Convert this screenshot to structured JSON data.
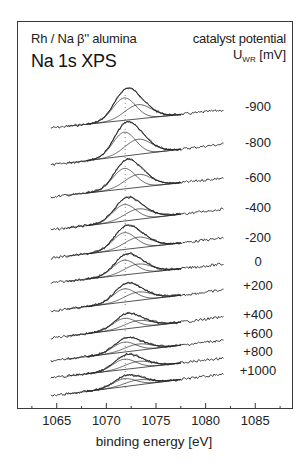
{
  "chart_data": {
    "type": "line",
    "title": "Na 1s XPS",
    "subtitle": "Rh / Na β'' alumina",
    "xlabel": "binding energy [eV]",
    "ylabel": "",
    "legend_title": "catalyst potential",
    "legend_unit_main": "U",
    "legend_unit_sub": "WR",
    "legend_unit_tail": " [mV]",
    "legend_position": "right",
    "grid": false,
    "xlim": [
      1061,
      1088.8
    ],
    "x_ticks_major": [
      1065,
      1070,
      1075,
      1080,
      1085
    ],
    "x_tick_labels": [
      "1065",
      "1070",
      "1075",
      "1080",
      "1085"
    ],
    "x_ticks_minor": [
      1062.5,
      1067.5,
      1072.5,
      1077.5,
      1082.5,
      1087.5
    ],
    "spectrum_range_eV": [
      1064.4,
      1081.8
    ],
    "peak_component_1_eV": 1071.8,
    "peak_component_2_eV": 1073.2,
    "series": [
      {
        "name": "-900",
        "baseline_left_y": 128,
        "baseline_right_y": 110,
        "peak_top_y": 93,
        "label_y": 107
      },
      {
        "name": "-800",
        "baseline_left_y": 165,
        "baseline_right_y": 144,
        "peak_top_y": 127,
        "label_y": 143
      },
      {
        "name": "-600",
        "baseline_left_y": 197,
        "baseline_right_y": 178,
        "peak_top_y": 164,
        "label_y": 178
      },
      {
        "name": "-400",
        "baseline_left_y": 230,
        "baseline_right_y": 209,
        "peak_top_y": 201,
        "label_y": 208
      },
      {
        "name": "-200",
        "baseline_left_y": 258,
        "baseline_right_y": 238,
        "peak_top_y": 229,
        "label_y": 238
      },
      {
        "name": "0",
        "baseline_left_y": 283,
        "baseline_right_y": 264,
        "peak_top_y": 257,
        "label_y": 262
      },
      {
        "name": "+200",
        "baseline_left_y": 311,
        "baseline_right_y": 290,
        "peak_top_y": 286,
        "label_y": 286
      },
      {
        "name": "+400",
        "baseline_left_y": 338,
        "baseline_right_y": 317,
        "peak_top_y": 316,
        "label_y": 315
      },
      {
        "name": "+600",
        "baseline_left_y": 361,
        "baseline_right_y": 340,
        "peak_top_y": 340,
        "label_y": 334
      },
      {
        "name": "+800",
        "baseline_left_y": 378,
        "baseline_right_y": 358,
        "peak_top_y": 357,
        "label_y": 352
      },
      {
        "name": "+1000",
        "baseline_left_y": 396,
        "baseline_right_y": 374,
        "peak_top_y": 377,
        "label_y": 371
      }
    ],
    "line_color": "#2a2a2a",
    "frame_color": "#3a3a3a"
  }
}
